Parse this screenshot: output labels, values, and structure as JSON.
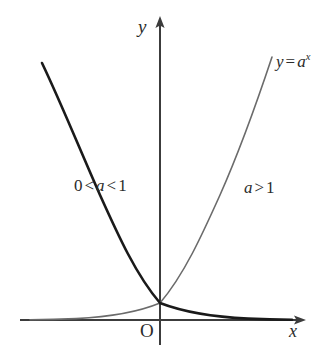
{
  "figure": {
    "background_color": "#ffffff",
    "width": 329,
    "height": 360
  },
  "axes": {
    "color": "#3c3c3c",
    "stroke_width": 1.1,
    "origin": {
      "x": 160,
      "y": 320
    },
    "x_axis": {
      "start_x": 20,
      "end_x": 306,
      "y": 320,
      "arrow": "right"
    },
    "y_axis": {
      "x": 160,
      "start_y": 345,
      "end_y": 16,
      "arrow": "up"
    },
    "x_label": "x",
    "y_label": "y",
    "origin_label": "O"
  },
  "labels": {
    "equation": {
      "lhs": "y",
      "eq": "=",
      "base": "a",
      "exponent": "x"
    },
    "decay_range": {
      "lower": "0",
      "op1": "<",
      "base": "a",
      "op2": "<",
      "upper": "1"
    },
    "growth_range": {
      "base": "a",
      "op": ">",
      "value": "1"
    }
  },
  "chart_data": {
    "type": "line",
    "title": "",
    "xlabel": "x",
    "ylabel": "y",
    "grid": false,
    "legend": "inline-annotation",
    "axis_origin_label": "O",
    "intersection_point": {
      "x": 0,
      "y": 1,
      "pixel": [
        160,
        303
      ]
    },
    "series": [
      {
        "name": "0 < a < 1",
        "label": "0 < a < 1",
        "function": "y = a^x, 0 < a < 1",
        "behavior": "decreasing",
        "color": "#1a1a1a",
        "stroke_width": 2.6,
        "label_pixel": [
          74,
          190
        ],
        "path": "M 42,63 C 62,105 80,150 100,195 C 118,235 136,275 160,303 C 186,313 214,317 248,318.6 C 268,319.3 282,319.6 292,319.8"
      },
      {
        "name": "a > 1",
        "label": "a > 1",
        "function": "y = a^x, a > 1",
        "behavior": "increasing",
        "color": "#6b6b6b",
        "stroke_width": 1.6,
        "label_pixel": [
          244,
          192
        ],
        "path": "M 30,319.8 C 44,319.6 58,319.3 76,318.6 C 108,317 136,313 160,303 C 184,275 202,235 220,195 C 240,150 256,105 272,57"
      }
    ]
  }
}
